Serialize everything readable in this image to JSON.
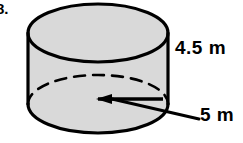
{
  "figure": {
    "type": "cylinder",
    "problem_number": "8.",
    "shape_name": "cylinder",
    "fill_color": "#d9d9d9",
    "stroke_color": "#000000",
    "background_color": "#ffffff",
    "labels": {
      "height": "4.5 m",
      "diameter": "5 m"
    },
    "annotations": {
      "height_value": "4.5",
      "height_unit": "m",
      "diameter_value": "5",
      "diameter_unit": "m",
      "hidden_edge_style": "dashed",
      "visible_edge_style": "solid",
      "leader_line": "arrow-pointing-left-into-base"
    },
    "geometry": {
      "top_ellipse_center_x": 98,
      "top_ellipse_center_y": 33,
      "bottom_ellipse_center_x": 98,
      "bottom_ellipse_center_y": 104,
      "ellipse_rx": 70,
      "ellipse_ry": 29,
      "left_wall_x": 28,
      "right_wall_x": 168,
      "wall_top_y": 33,
      "wall_bottom_y": 104
    }
  }
}
